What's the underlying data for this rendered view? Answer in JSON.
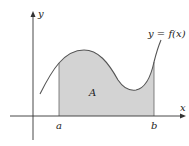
{
  "diagram": {
    "axes": {
      "x_label": "x",
      "y_label": "y"
    },
    "curve_label": "y = f(x)",
    "region_label": "A",
    "bounds": {
      "left": "a",
      "right": "b"
    },
    "colors": {
      "fill": "#d3d3d3",
      "stroke": "#555555",
      "axis": "#333333"
    }
  }
}
